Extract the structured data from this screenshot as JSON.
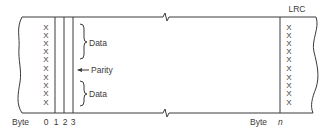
{
  "diagram": {
    "colors": {
      "line": "#3a3a3a",
      "background": "#ffffff"
    },
    "rows": 10,
    "bit_mark": "X",
    "left_block": {
      "byte_label": "Byte",
      "byte_indices": [
        "0",
        "1",
        "2",
        "3"
      ],
      "annotations": {
        "data_top": "Data",
        "parity": "Parity",
        "data_bottom": "Data"
      }
    },
    "right_block": {
      "header": "LRC",
      "byte_label": "Byte",
      "byte_index": "n"
    }
  }
}
